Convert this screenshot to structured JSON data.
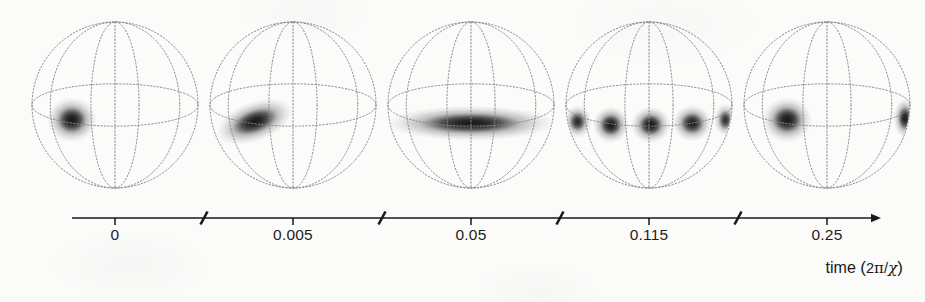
{
  "figure": {
    "kind": "bloch-sphere-time-series",
    "background_color": "#fbfbfa",
    "ink_color": "#1a1a1a",
    "wireframe_color": "#8a8a8a",
    "density_color": "#101010"
  },
  "axis": {
    "title_prefix": "time ",
    "title_open": "(",
    "title_coefficient": "2",
    "title_pi": "π",
    "title_slash": "/",
    "title_chi": "χ",
    "title_close": ")",
    "title_full": "time (2π/χ)",
    "arrow": "right-arrow",
    "has_breaks": true,
    "break_count": 4,
    "tick_labels": [
      "0",
      "0.005",
      "0.05",
      "0.115",
      "0.25"
    ]
  },
  "chart_data": {
    "type": "scatter",
    "title": "",
    "xlabel": "time (2π/χ)",
    "ylabel": "",
    "grid": false,
    "legend": "none",
    "x_tick_labels": [
      "0",
      "0.005",
      "0.05",
      "0.115",
      "0.25"
    ],
    "x_tick_values": [
      0,
      0.005,
      0.05,
      0.115,
      0.25
    ],
    "x_axis_broken": true,
    "x_break_positions": [
      0.5,
      1.5,
      2.5,
      3.5
    ],
    "panel_centers_px": [
      115,
      293,
      471,
      649,
      827
    ],
    "panel_radius_px": 83,
    "series": [
      {
        "name": "Husimi Q distribution on Bloch sphere",
        "panels": [
          {
            "index": 0,
            "time": "0",
            "state": "coherent-state-blob",
            "description": "single compact round blob left of centre, just below equator",
            "lobes": [
              {
                "cx": -0.52,
                "cy": 0.18,
                "rx": 0.3,
                "ry": 0.27,
                "intensity": 1.0,
                "angle": 0
              }
            ]
          },
          {
            "index": 1,
            "time": "0.005",
            "state": "sheared-blob",
            "description": "blob stretched and tilted diagonally, start of squeezing",
            "lobes": [
              {
                "cx": -0.46,
                "cy": 0.2,
                "rx": 0.48,
                "ry": 0.24,
                "intensity": 1.0,
                "angle": -20
              }
            ]
          },
          {
            "index": 2,
            "time": "0.05",
            "state": "wrapped-band",
            "description": "distribution smeared into a continuous band encircling the sphere below the equator",
            "lobes": [
              {
                "cx": 0.0,
                "cy": 0.22,
                "rx": 1.02,
                "ry": 0.21,
                "intensity": 1.0,
                "angle": 0
              }
            ]
          },
          {
            "index": 3,
            "time": "0.115",
            "state": "multi-lobed-band",
            "description": "band broken into four interference lobes with bright gaps",
            "lobes": [
              {
                "cx": -0.86,
                "cy": 0.2,
                "rx": 0.17,
                "ry": 0.2,
                "intensity": 0.85,
                "angle": 0
              },
              {
                "cx": -0.46,
                "cy": 0.24,
                "rx": 0.22,
                "ry": 0.22,
                "intensity": 1.0,
                "angle": 0
              },
              {
                "cx": 0.02,
                "cy": 0.24,
                "rx": 0.24,
                "ry": 0.22,
                "intensity": 1.0,
                "angle": 0
              },
              {
                "cx": 0.52,
                "cy": 0.22,
                "rx": 0.24,
                "ry": 0.22,
                "intensity": 0.95,
                "angle": 0
              },
              {
                "cx": 0.92,
                "cy": 0.18,
                "rx": 0.14,
                "ry": 0.2,
                "intensity": 0.8,
                "angle": 0
              }
            ]
          },
          {
            "index": 4,
            "time": "0.25",
            "state": "cat-state-two-lobes",
            "description": "two well separated blobs on opposite sides, the right one clipped at the limb",
            "lobes": [
              {
                "cx": -0.48,
                "cy": 0.18,
                "rx": 0.3,
                "ry": 0.27,
                "intensity": 1.0,
                "angle": 0
              },
              {
                "cx": 0.94,
                "cy": 0.16,
                "rx": 0.14,
                "ry": 0.24,
                "intensity": 0.95,
                "angle": 0
              }
            ]
          }
        ]
      }
    ]
  }
}
